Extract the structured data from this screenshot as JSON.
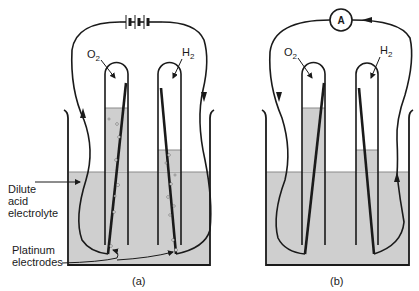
{
  "figure": {
    "panels": [
      {
        "id": "a",
        "caption": "(a)",
        "source": "battery",
        "tubes": [
          {
            "gas": "O",
            "gas_sub": "2"
          },
          {
            "gas": "H",
            "gas_sub": "2"
          }
        ]
      },
      {
        "id": "b",
        "caption": "(b)",
        "source": "ammeter",
        "meter_label": "A",
        "tubes": [
          {
            "gas": "O",
            "gas_sub": "2"
          },
          {
            "gas": "H",
            "gas_sub": "2"
          }
        ]
      }
    ],
    "labels": {
      "electrolyte_line1": "Dilute",
      "electrolyte_line2": "acid",
      "electrolyte_line3": "electrolyte",
      "electrodes_line1": "Platinum",
      "electrodes_line2": "electrodes"
    },
    "colors": {
      "line": "#1a1a1a",
      "electrolyte": "#cfcfcf",
      "background": "#ffffff"
    }
  }
}
